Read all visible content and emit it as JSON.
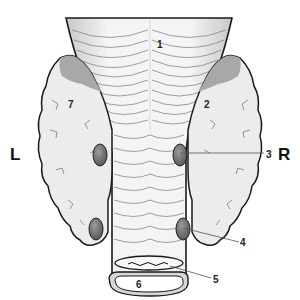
{
  "diagram": {
    "side_labels": {
      "left": "L",
      "right": "R"
    },
    "numbers": {
      "n1": "1",
      "n2": "2",
      "n3": "3",
      "n4": "4",
      "n5": "5",
      "n6": "6",
      "n7": "7"
    },
    "colors": {
      "outline": "#1a1a1a",
      "gland_fill": "#ececec",
      "gland_shade": "#a8a8a8",
      "nodule_fill": "#7a7a7a",
      "tube_fill": "#f4f4f4",
      "leader": "#555555"
    }
  }
}
